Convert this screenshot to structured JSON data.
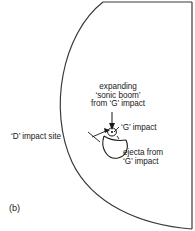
{
  "figure": {
    "panel_label": "(b)",
    "annotations": {
      "sonic_boom": {
        "line1": "expanding",
        "line2": "‘sonic boom’",
        "line3": "from ‘G’ impact"
      },
      "g_impact": "‘G’ impact",
      "d_impact_site": "‘D’ impact site",
      "ejecta": {
        "line1": "ejecta from",
        "line2": "‘G’ impact"
      }
    },
    "colors": {
      "stroke": "#1a1a1a",
      "background": "#ffffff",
      "text": "#1a1a1a"
    }
  }
}
